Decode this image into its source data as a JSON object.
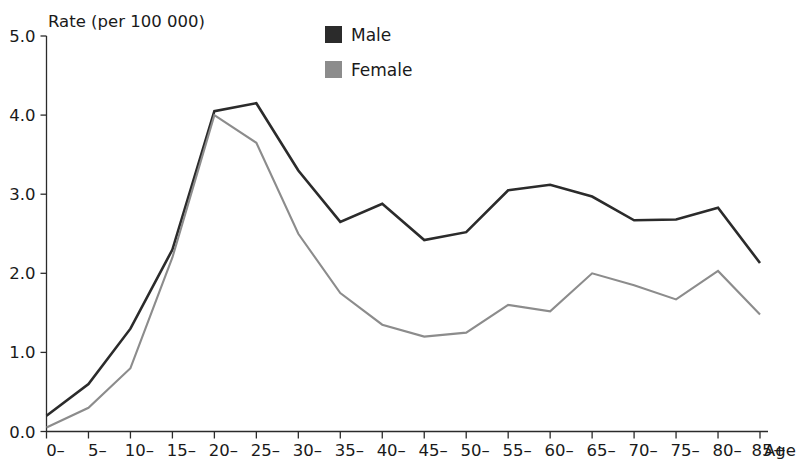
{
  "chart_data": {
    "type": "line",
    "title": "",
    "ylabel": "Rate (per 100 000)",
    "xlabel": "Age",
    "categories": [
      "0–",
      "5–",
      "10–",
      "15–",
      "20–",
      "25–",
      "30–",
      "35–",
      "40–",
      "45–",
      "50–",
      "55–",
      "60–",
      "65–",
      "70–",
      "75–",
      "80–",
      "85+"
    ],
    "ylim": [
      0.0,
      5.0
    ],
    "ytick_labels": [
      "0.0",
      "1.0",
      "2.0",
      "3.0",
      "4.0",
      "5.0"
    ],
    "ytick_values": [
      0.0,
      1.0,
      2.0,
      3.0,
      4.0,
      5.0
    ],
    "grid": false,
    "legend_position": "top-center",
    "series": [
      {
        "name": "Male",
        "color": "#2b2b2b",
        "values": [
          0.2,
          0.6,
          1.3,
          2.3,
          4.05,
          4.15,
          3.3,
          2.65,
          2.88,
          2.42,
          2.52,
          3.05,
          3.12,
          2.97,
          2.67,
          2.68,
          2.83,
          2.13
        ]
      },
      {
        "name": "Female",
        "color": "#8c8c8c",
        "values": [
          0.05,
          0.3,
          0.8,
          2.2,
          4.0,
          3.65,
          2.5,
          1.75,
          1.35,
          1.2,
          1.25,
          1.6,
          1.52,
          2.0,
          1.85,
          1.67,
          2.03,
          1.48
        ]
      }
    ]
  },
  "legend": {
    "items": [
      {
        "label": "Male",
        "color": "#2b2b2b"
      },
      {
        "label": "Female",
        "color": "#8c8c8c"
      }
    ]
  },
  "axes": {
    "y_title": "Rate (per 100 000)",
    "x_title": "Age"
  }
}
